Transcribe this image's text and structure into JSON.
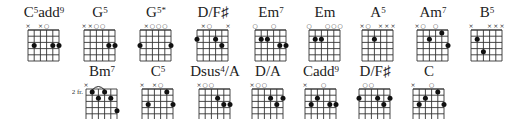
{
  "rows": [
    {
      "y": 4,
      "chords": [
        {
          "x": 26,
          "base": "C",
          "sup": "5",
          "suffix": "add",
          "sup2": "9",
          "markers": [
            "x",
            "",
            "x",
            "o",
            "",
            ""
          ],
          "fret_label": "",
          "dots": [
            [
              1,
              3
            ],
            [
              4,
              3
            ],
            [
              5,
              3
            ]
          ],
          "barre": null
        },
        {
          "x": 82,
          "base": "G",
          "sup": "5",
          "suffix": "",
          "sup2": "",
          "markers": [
            "x",
            "x",
            "o",
            "o",
            "",
            ""
          ],
          "fret_label": "",
          "dots": [
            [
              4,
              3
            ],
            [
              5,
              3
            ]
          ],
          "barre": null
        },
        {
          "x": 138,
          "base": "G",
          "sup": "5*",
          "suffix": "",
          "sup2": "",
          "markers": [
            "",
            "x",
            "o",
            "o",
            "o",
            ""
          ],
          "fret_label": "",
          "dots": [
            [
              0,
              3
            ],
            [
              5,
              3
            ]
          ],
          "barre": null
        },
        {
          "x": 195,
          "base": "D/F♯",
          "sup": "",
          "suffix": "",
          "sup2": "",
          "markers": [
            "",
            "x",
            "o",
            "",
            "",
            "x"
          ],
          "fret_label": "",
          "dots": [
            [
              0,
              2
            ],
            [
              3,
              2
            ],
            [
              4,
              3
            ]
          ],
          "barre": null
        },
        {
          "x": 253,
          "base": "Em",
          "sup": "7",
          "suffix": "",
          "sup2": "",
          "markers": [
            "o",
            "",
            "",
            "o",
            "",
            ""
          ],
          "fret_label": "",
          "dots": [
            [
              1,
              2
            ],
            [
              2,
              2
            ],
            [
              4,
              3
            ],
            [
              5,
              3
            ]
          ],
          "barre": null
        },
        {
          "x": 307,
          "base": "Em",
          "sup": "",
          "suffix": "",
          "sup2": "",
          "markers": [
            "o",
            "",
            "",
            "o",
            "o",
            "o"
          ],
          "fret_label": "",
          "dots": [
            [
              1,
              2
            ],
            [
              2,
              2
            ]
          ],
          "barre": null
        },
        {
          "x": 360,
          "base": "A",
          "sup": "5",
          "suffix": "",
          "sup2": "",
          "markers": [
            "x",
            "o",
            "",
            "x",
            "x",
            "x"
          ],
          "fret_label": "",
          "dots": [
            [
              2,
              2
            ]
          ],
          "barre": null
        },
        {
          "x": 415,
          "base": "Am",
          "sup": "7",
          "suffix": "",
          "sup2": "",
          "markers": [
            "x",
            "o",
            "",
            "o",
            "",
            ""
          ],
          "fret_label": "",
          "dots": [
            [
              2,
              2
            ],
            [
              4,
              1
            ],
            [
              5,
              3
            ]
          ],
          "barre": null
        },
        {
          "x": 469,
          "base": "B",
          "sup": "5",
          "suffix": "",
          "sup2": "",
          "markers": [
            "x",
            "",
            "",
            "x",
            "x",
            "x"
          ],
          "fret_label": "",
          "dots": [
            [
              1,
              2
            ],
            [
              2,
              4
            ]
          ],
          "barre": null
        }
      ]
    },
    {
      "y": 63,
      "chords": [
        {
          "x": 84,
          "base": "Bm",
          "sup": "7",
          "suffix": "",
          "sup2": "",
          "markers": [
            "x",
            "",
            "",
            "",
            "",
            ""
          ],
          "fret_label": "2 fr.",
          "dots": [
            [
              1,
              1
            ],
            [
              3,
              1
            ],
            [
              2,
              2
            ],
            [
              4,
              2
            ],
            [
              5,
              4
            ]
          ],
          "barre": [
            1,
            3
          ]
        },
        {
          "x": 140,
          "base": "C",
          "sup": "5",
          "suffix": "",
          "sup2": "",
          "markers": [
            "x",
            "",
            "x",
            "o",
            "",
            ""
          ],
          "fret_label": "",
          "dots": [
            [
              1,
              3
            ],
            [
              4,
              1
            ],
            [
              5,
              3
            ]
          ],
          "barre": null
        },
        {
          "x": 197,
          "base": "Dsus",
          "sup": "4",
          "suffix": "/A",
          "sup2": "",
          "markers": [
            "x",
            "o",
            "o",
            "",
            "",
            ""
          ],
          "fret_label": "",
          "dots": [
            [
              3,
              2
            ],
            [
              4,
              3
            ],
            [
              5,
              3
            ]
          ],
          "barre": null
        },
        {
          "x": 250,
          "base": "D/A",
          "sup": "",
          "suffix": "",
          "sup2": "",
          "markers": [
            "x",
            "o",
            "o",
            "",
            "",
            ""
          ],
          "fret_label": "",
          "dots": [
            [
              3,
              2
            ],
            [
              4,
              3
            ],
            [
              5,
              2
            ]
          ],
          "barre": null
        },
        {
          "x": 303,
          "base": "C",
          "sup": "",
          "suffix": "add",
          "sup2": "9",
          "markers": [
            "x",
            "",
            "",
            "o",
            "",
            ""
          ],
          "fret_label": "",
          "dots": [
            [
              1,
              3
            ],
            [
              2,
              2
            ],
            [
              4,
              3
            ],
            [
              5,
              3
            ]
          ],
          "barre": null
        },
        {
          "x": 357,
          "base": "D/F♯",
          "sup": "",
          "suffix": "",
          "sup2": "",
          "markers": [
            "",
            "o",
            "o",
            "",
            "",
            ""
          ],
          "fret_label": "",
          "dots": [
            [
              0,
              2
            ],
            [
              3,
              2
            ],
            [
              4,
              3
            ],
            [
              5,
              2
            ]
          ],
          "barre": null
        },
        {
          "x": 411,
          "base": "C",
          "sup": "",
          "suffix": "",
          "sup2": "",
          "markers": [
            "x",
            "",
            "",
            "o",
            "",
            ""
          ],
          "fret_label": "",
          "dots": [
            [
              1,
              3
            ],
            [
              2,
              2
            ],
            [
              4,
              1
            ],
            [
              5,
              3
            ]
          ],
          "barre": null
        }
      ]
    }
  ]
}
